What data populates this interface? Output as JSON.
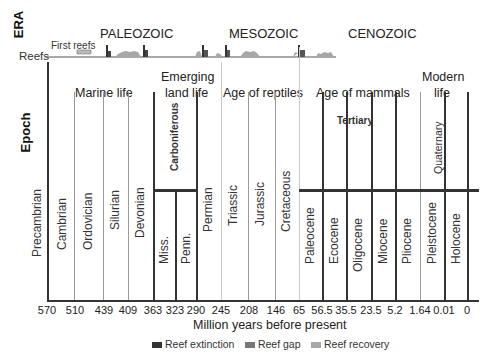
{
  "header": {
    "era_label": "ERA",
    "reefs_label": "Reefs",
    "first_reefs_label": "First reefs",
    "eras": [
      {
        "name": "PALEOZOIC"
      },
      {
        "name": "MESOZOIC"
      },
      {
        "name": "CENOZOIC"
      }
    ]
  },
  "epoch_label": "Epoch",
  "groups": {
    "marine_life": "Marine life",
    "emerging_land_life_1": "Emerging",
    "emerging_land_life_2": "land life",
    "age_of_reptiles": "Age of reptiles",
    "age_of_mammals": "Age of mammals",
    "modern_life_1": "Modern",
    "modern_life_2": "life"
  },
  "sub_periods": {
    "carboniferous": "Carboniferous",
    "tertiary": "Tertiary",
    "quaternary": "Quaternary"
  },
  "periods": [
    {
      "name": "Precambrian"
    },
    {
      "name": "Cambrian"
    },
    {
      "name": "Ordovician"
    },
    {
      "name": "Silurian"
    },
    {
      "name": "Devonian"
    },
    {
      "name": "Miss."
    },
    {
      "name": "Penn."
    },
    {
      "name": "Permian"
    },
    {
      "name": "Triassic"
    },
    {
      "name": "Jurassic"
    },
    {
      "name": "Cretaceous"
    },
    {
      "name": "Paleocene"
    },
    {
      "name": "Ecocene"
    },
    {
      "name": "Oligocene"
    },
    {
      "name": "Miocene"
    },
    {
      "name": "Pliocene"
    },
    {
      "name": "Pleistocene"
    },
    {
      "name": "Holocene"
    }
  ],
  "axis": {
    "ticks": [
      "570",
      "510",
      "439",
      "409",
      "363",
      "323",
      "290",
      "245",
      "208",
      "146",
      "65",
      "56.5",
      "35.5",
      "23.5",
      "5.2",
      "1.64",
      "0.01",
      "0"
    ],
    "title": "Million years before present"
  },
  "legend": {
    "items": [
      {
        "label": "Reef extinction",
        "color": "#333333"
      },
      {
        "label": "Reef gap",
        "color": "#777777"
      },
      {
        "label": "Reef recovery",
        "color": "#a8a8a8"
      }
    ]
  }
}
